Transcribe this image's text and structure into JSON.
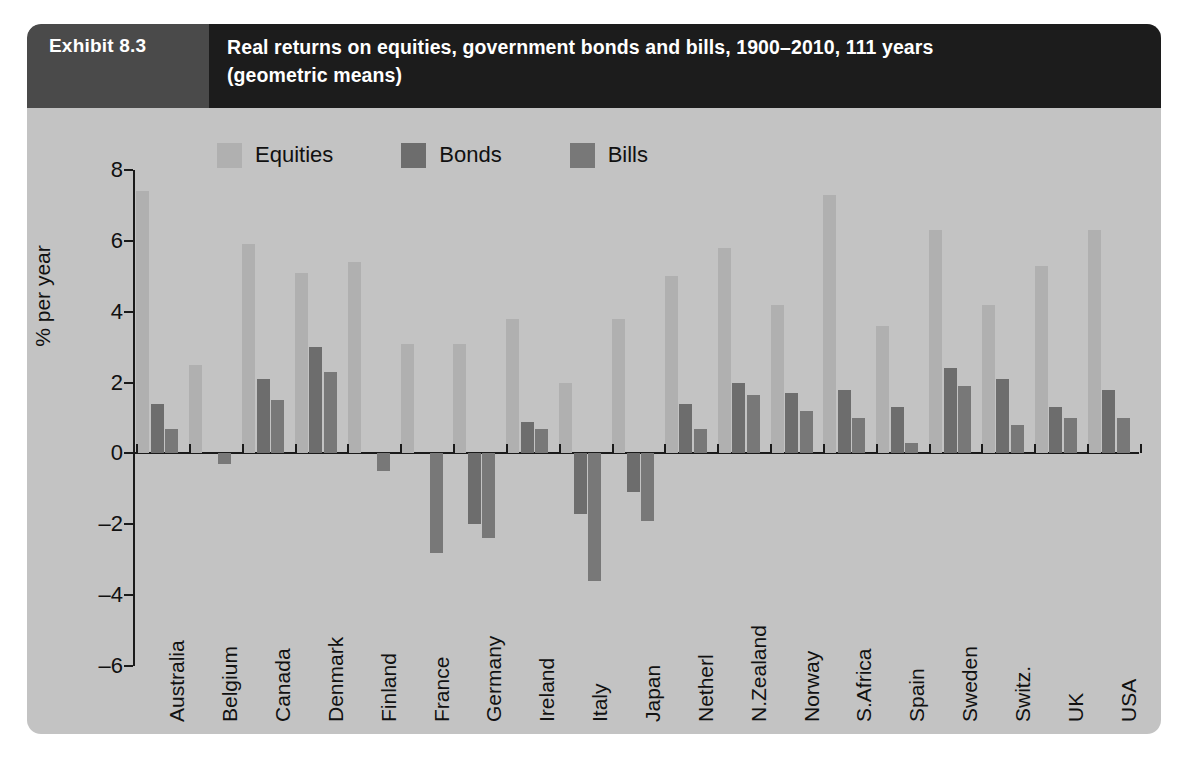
{
  "header": {
    "exhibit_label": "Exhibit 8.3",
    "title_line1": "Real returns on equities, government bonds and bills, 1900–2010, 111 years",
    "title_line2": "(geometric means)",
    "label_bg": "#4a4a4a",
    "title_bg": "#1c1c1c"
  },
  "panel": {
    "background": "#c3c3c3"
  },
  "legend": {
    "position": "top-left-inside",
    "items": [
      {
        "label": "Equities",
        "color": "#b0b0b0",
        "key": "equities"
      },
      {
        "label": "Bonds",
        "color": "#6d6d6d",
        "key": "bonds"
      },
      {
        "label": "Bills",
        "color": "#787878",
        "key": "bills"
      }
    ]
  },
  "chart_data": {
    "type": "bar",
    "title": "Real returns on equities, government bonds and bills, 1900–2010, 111 years (geometric means)",
    "xlabel": "",
    "ylabel": "% per year",
    "ylim": [
      -6,
      8
    ],
    "yticks": [
      8,
      6,
      4,
      2,
      0,
      -2,
      -4,
      -6
    ],
    "ytick_labels": [
      "8",
      "6",
      "4",
      "2",
      "0",
      "–2",
      "–4",
      "–6"
    ],
    "grid": false,
    "legend_position": "inside top-left",
    "categories": [
      "Australia",
      "Belgium",
      "Canada",
      "Denmark",
      "Finland",
      "France",
      "Germany",
      "Ireland",
      "Italy",
      "Japan",
      "Netherl",
      "N.Zealand",
      "Norway",
      "S.Africa",
      "Spain",
      "Sweden",
      "Switz.",
      "UK",
      "USA"
    ],
    "series": [
      {
        "name": "Equities",
        "color": "#b0b0b0",
        "values": [
          7.4,
          2.5,
          5.9,
          5.1,
          5.4,
          3.1,
          3.1,
          3.8,
          2.0,
          3.8,
          5.0,
          5.8,
          4.2,
          7.3,
          3.6,
          6.3,
          4.2,
          5.3,
          6.3
        ]
      },
      {
        "name": "Bonds",
        "color": "#6d6d6d",
        "values": [
          1.4,
          0.0,
          2.1,
          3.0,
          0.0,
          0.0,
          -2.0,
          0.9,
          -1.7,
          -1.1,
          1.4,
          2.0,
          1.7,
          1.8,
          1.3,
          2.4,
          2.1,
          1.3,
          1.8
        ]
      },
      {
        "name": "Bills",
        "color": "#787878",
        "values": [
          0.7,
          -0.3,
          1.5,
          2.3,
          -0.5,
          -2.8,
          -2.4,
          0.7,
          -3.6,
          -1.9,
          0.7,
          1.65,
          1.2,
          1.0,
          0.3,
          1.9,
          0.8,
          1.0,
          1.0
        ]
      }
    ]
  }
}
